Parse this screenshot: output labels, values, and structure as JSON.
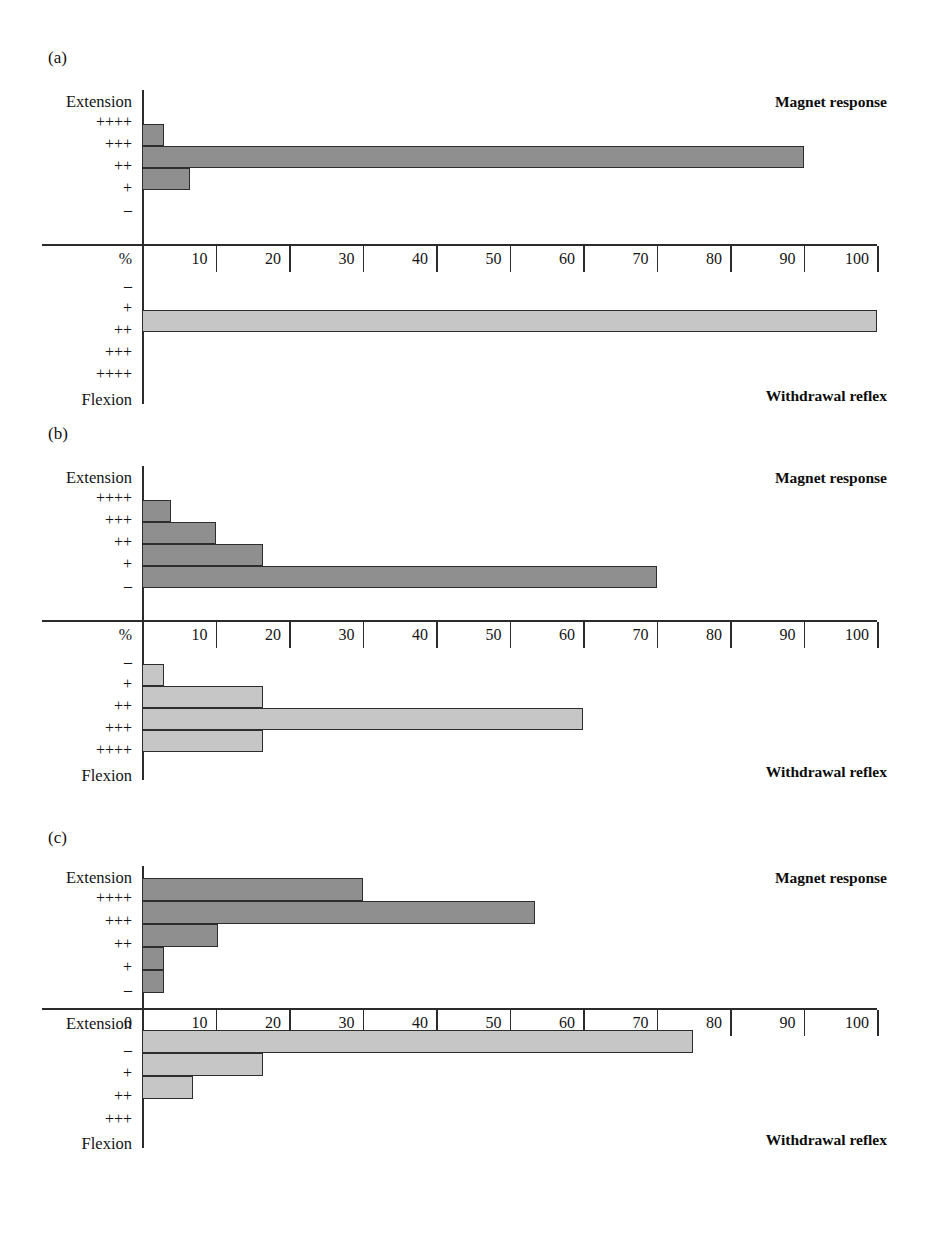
{
  "figure": {
    "panels": [
      {
        "id": "a",
        "label": "(a)",
        "top_series_title": "Magnet response",
        "bottom_series_title": "Withdrawal reflex",
        "top_axis_corner_label": "Extension",
        "bottom_axis_corner_label": "Flexion",
        "axis_unit_label": "%",
        "top_categories": [
          "++++",
          "+++",
          "++",
          "+",
          "–"
        ],
        "top_values": [
          0,
          3,
          90,
          6.5,
          0
        ],
        "bottom_categories": [
          "–",
          "+",
          "++",
          "+++",
          "++++"
        ],
        "bottom_values": [
          0,
          0,
          100,
          0,
          0
        ]
      },
      {
        "id": "b",
        "label": "(b)",
        "top_series_title": "Magnet response",
        "bottom_series_title": "Withdrawal reflex",
        "top_axis_corner_label": "Extension",
        "bottom_axis_corner_label": "Flexion",
        "axis_unit_label": "%",
        "top_categories": [
          "++++",
          "+++",
          "++",
          "+",
          "–"
        ],
        "top_values": [
          0,
          4,
          10,
          16.5,
          70
        ],
        "bottom_categories": [
          "–",
          "+",
          "++",
          "+++",
          "++++"
        ],
        "bottom_values": [
          0,
          3,
          16.5,
          60,
          16.5
        ]
      },
      {
        "id": "c",
        "label": "(c)",
        "top_series_title": "Magnet response",
        "bottom_series_title": "Withdrawal reflex",
        "top_axis_corner_label": "Extension",
        "bottom_axis_corner_label": "Extension",
        "bottom_left_corner_label": "Flexion",
        "axis_unit_label": "0",
        "top_categories": [
          "++++",
          "+++",
          "++",
          "+",
          "–"
        ],
        "top_values": [
          30,
          53.5,
          10.3,
          3,
          3
        ],
        "bottom_categories": [
          "–",
          "+",
          "++",
          "+++"
        ],
        "bottom_values": [
          75,
          16.5,
          7,
          0
        ]
      }
    ],
    "x_ticks": [
      10,
      20,
      30,
      40,
      50,
      60,
      70,
      80,
      90,
      100
    ],
    "x_tick_labels": [
      "10",
      "20",
      "30",
      "40",
      "50",
      "60",
      "70",
      "80",
      "90",
      "100"
    ]
  },
  "chart_data": {
    "type": "bar",
    "title": "",
    "orientation": "horizontal",
    "xlabel": "%",
    "ylabel": "",
    "xlim": [
      0,
      100
    ],
    "grid": false,
    "legend": "none",
    "axis_tick_labels": [
      "10",
      "20",
      "30",
      "40",
      "50",
      "60",
      "70",
      "80",
      "90",
      "100"
    ],
    "colors": {
      "magnet_response": "#8f8f8f",
      "withdrawal_reflex": "#c6c6c6",
      "axis": "#2b2b2b"
    },
    "panels": [
      {
        "panel": "(a)",
        "series": [
          {
            "name": "Magnet response",
            "direction": "Extension",
            "categories": [
              "++++",
              "+++",
              "++",
              "+",
              "–"
            ],
            "values": [
              0,
              3,
              90,
              6.5,
              0
            ]
          },
          {
            "name": "Withdrawal reflex",
            "direction": "Flexion",
            "categories": [
              "–",
              "+",
              "++",
              "+++",
              "++++"
            ],
            "values": [
              0,
              0,
              100,
              0,
              0
            ]
          }
        ]
      },
      {
        "panel": "(b)",
        "series": [
          {
            "name": "Magnet response",
            "direction": "Extension",
            "categories": [
              "++++",
              "+++",
              "++",
              "+",
              "–"
            ],
            "values": [
              0,
              4,
              10,
              16.5,
              70
            ]
          },
          {
            "name": "Withdrawal reflex",
            "direction": "Flexion",
            "categories": [
              "–",
              "+",
              "++",
              "+++",
              "++++"
            ],
            "values": [
              0,
              3,
              16.5,
              60,
              16.5
            ]
          }
        ]
      },
      {
        "panel": "(c)",
        "series": [
          {
            "name": "Magnet response",
            "direction": "Extension",
            "categories": [
              "++++",
              "+++",
              "++",
              "+",
              "–"
            ],
            "values": [
              30,
              53.5,
              10.3,
              3,
              3
            ]
          },
          {
            "name": "Withdrawal reflex",
            "direction": "Extension-to-Flexion",
            "categories": [
              "–",
              "+",
              "++",
              "+++"
            ],
            "values": [
              75,
              16.5,
              7,
              0
            ]
          }
        ]
      }
    ]
  }
}
